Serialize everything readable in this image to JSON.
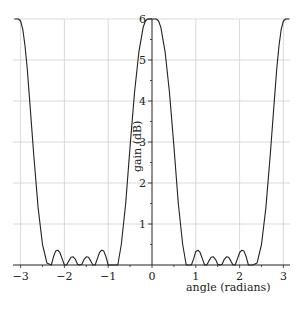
{
  "chart_data": {
    "type": "line",
    "title": "",
    "xlabel": "angle (radians)",
    "ylabel": "gain (dB)",
    "xlim": [
      -3.14,
      3.14
    ],
    "ylim": [
      0,
      6
    ],
    "xticks": [
      -3,
      -2,
      -1,
      0,
      1,
      2,
      3
    ],
    "xtick_labels": [
      "−3",
      "−2",
      "−1",
      "0",
      "1",
      "2",
      "3"
    ],
    "yticks": [
      1,
      2,
      3,
      4,
      5,
      6
    ],
    "ytick_labels": [
      "1",
      "2",
      "3",
      "4",
      "5",
      "6"
    ],
    "y_minor_ticks": [
      0.5,
      1.5,
      2.5,
      3.5,
      4.5,
      5.5
    ],
    "grid": true,
    "legend": null,
    "series": [
      {
        "name": "gain",
        "x": [
          -3.14,
          -3.05,
          -3.0,
          -2.95,
          -2.9,
          -2.85,
          -2.8,
          -2.7,
          -2.6,
          -2.5,
          -2.4,
          -2.3,
          -2.25,
          -2.2,
          -2.15,
          -2.1,
          -2.05,
          -2.0,
          -1.95,
          -1.9,
          -1.85,
          -1.8,
          -1.75,
          -1.7,
          -1.65,
          -1.6,
          -1.55,
          -1.5,
          -1.45,
          -1.4,
          -1.35,
          -1.3,
          -1.25,
          -1.2,
          -1.15,
          -1.1,
          -1.05,
          -1.0,
          -0.95,
          -0.9,
          -0.85,
          -0.78,
          -0.7,
          -0.6,
          -0.5,
          -0.4,
          -0.3,
          -0.2,
          -0.15,
          -0.1,
          0.0,
          0.1,
          0.15,
          0.2,
          0.3,
          0.4,
          0.5,
          0.6,
          0.7,
          0.78,
          0.85,
          0.9,
          0.95,
          1.0,
          1.05,
          1.1,
          1.15,
          1.2,
          1.25,
          1.3,
          1.35,
          1.4,
          1.45,
          1.5,
          1.55,
          1.6,
          1.65,
          1.7,
          1.75,
          1.8,
          1.85,
          1.9,
          1.95,
          2.0,
          2.05,
          2.1,
          2.15,
          2.2,
          2.25,
          2.3,
          2.4,
          2.5,
          2.6,
          2.7,
          2.8,
          2.85,
          2.9,
          2.95,
          3.0,
          3.05,
          3.14
        ],
        "y": [
          6.0,
          6.0,
          5.95,
          5.75,
          5.35,
          4.8,
          4.1,
          2.7,
          1.4,
          0.5,
          0.05,
          0.0,
          0.2,
          0.34,
          0.36,
          0.3,
          0.15,
          0.0,
          0.0,
          0.1,
          0.19,
          0.2,
          0.14,
          0.02,
          0.0,
          0.02,
          0.14,
          0.2,
          0.19,
          0.1,
          0.0,
          0.0,
          0.15,
          0.3,
          0.36,
          0.34,
          0.2,
          0.0,
          0.0,
          0.0,
          0.0,
          0.0,
          0.5,
          1.5,
          2.9,
          4.2,
          5.2,
          5.8,
          5.95,
          6.0,
          6.0,
          6.0,
          5.95,
          5.8,
          5.2,
          4.2,
          2.9,
          1.5,
          0.5,
          0.0,
          0.0,
          0.0,
          0.15,
          0.33,
          0.36,
          0.3,
          0.15,
          0.0,
          0.0,
          0.1,
          0.19,
          0.2,
          0.14,
          0.02,
          0.0,
          0.02,
          0.14,
          0.2,
          0.19,
          0.1,
          0.0,
          0.0,
          0.15,
          0.3,
          0.36,
          0.34,
          0.2,
          0.0,
          0.0,
          0.0,
          0.05,
          0.5,
          1.4,
          2.7,
          4.1,
          4.8,
          5.35,
          5.75,
          5.95,
          6.0,
          6.0
        ]
      }
    ]
  }
}
